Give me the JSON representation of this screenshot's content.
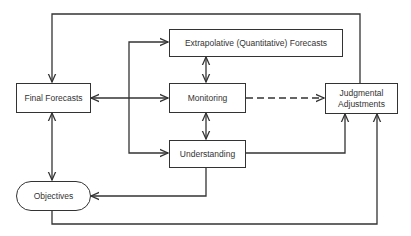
{
  "diagram": {
    "type": "flowchart",
    "nodes": {
      "final_forecasts": "Final Forecasts",
      "extrapolative": "Extrapolative (Quantitative) Forecasts",
      "monitoring": "Monitoring",
      "understanding": "Understanding",
      "judgmental": "Judgmental Adjustments",
      "objectives": "Objectives"
    },
    "edges": [
      {
        "from": "judgmental",
        "to": "final_forecasts",
        "style": "solid"
      },
      {
        "from": "final_forecasts",
        "to": "monitoring",
        "style": "solid",
        "bidirectional": true
      },
      {
        "from": "final_forecasts",
        "to": "extrapolative",
        "style": "solid"
      },
      {
        "from": "final_forecasts",
        "to": "understanding",
        "style": "solid"
      },
      {
        "from": "extrapolative",
        "to": "monitoring",
        "style": "solid",
        "bidirectional": true
      },
      {
        "from": "monitoring",
        "to": "understanding",
        "style": "solid",
        "bidirectional": true
      },
      {
        "from": "monitoring",
        "to": "judgmental",
        "style": "dashed"
      },
      {
        "from": "understanding",
        "to": "judgmental",
        "style": "solid"
      },
      {
        "from": "understanding",
        "to": "objectives",
        "style": "solid"
      },
      {
        "from": "final_forecasts",
        "to": "objectives",
        "style": "solid",
        "bidirectional": true
      },
      {
        "from": "objectives",
        "to": "judgmental",
        "style": "solid"
      }
    ],
    "colors": {
      "line": "#333333",
      "background": "#ffffff"
    }
  }
}
